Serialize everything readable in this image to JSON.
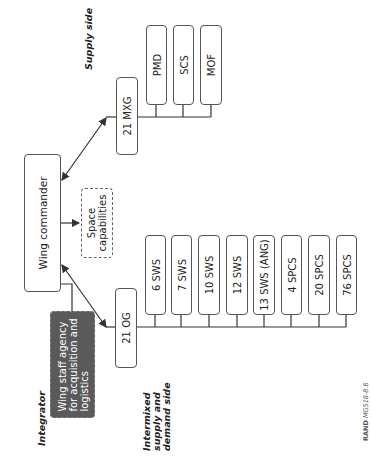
{
  "diagram": {
    "labels": {
      "supply_side": "Supply side",
      "integrator": "Integrator",
      "intermixed": [
        "Intermixed",
        "supply and",
        "demand side"
      ],
      "credit_prefix": "RAND",
      "credit_id": "MG518-8.6"
    },
    "nodes": {
      "wing_commander": "Wing commander",
      "space_capabilities": [
        "Space",
        "capabilities"
      ],
      "wing_staff_agency": [
        "Wing staff agency",
        "for acquisition and",
        "logistics"
      ],
      "mxg": "21 MXG",
      "og": "21 OG"
    },
    "supply_units": [
      "PMD",
      "SCS",
      "MOF"
    ],
    "demand_units": [
      "6 SWS",
      "7 SWS",
      "10 SWS",
      "12 SWS",
      "13 SWS (ANG)",
      "4 SPCS",
      "20 SPCS",
      "76 SPCS"
    ],
    "colors": {
      "line": "#333333",
      "box_border": "#555555",
      "dark_box": "#5a5a5a"
    }
  }
}
